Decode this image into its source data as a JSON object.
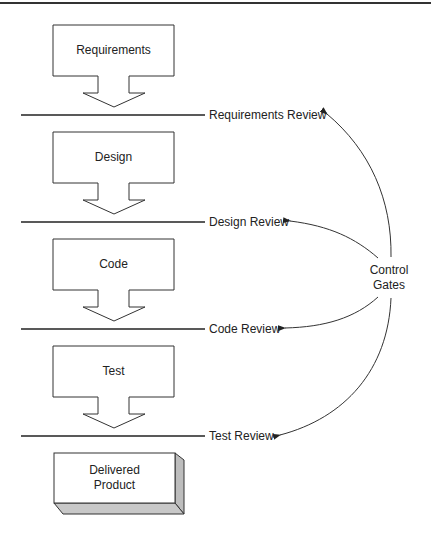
{
  "diagram": {
    "type": "waterfall-process-with-control-gates",
    "phases": [
      {
        "label": "Requirements"
      },
      {
        "label": "Design"
      },
      {
        "label": "Code"
      },
      {
        "label": "Test"
      }
    ],
    "reviews": [
      {
        "label": "Requirements Review"
      },
      {
        "label": "Design Review"
      },
      {
        "label": "Code Review"
      },
      {
        "label": "Test Review"
      }
    ],
    "output": {
      "line1": "Delivered",
      "line2": "Product"
    },
    "control_gates": {
      "line1": "Control",
      "line2": "Gates"
    },
    "colors": {
      "stroke": "#222222",
      "box_fill": "#ffffff",
      "shade": "#bdbdbd"
    }
  }
}
